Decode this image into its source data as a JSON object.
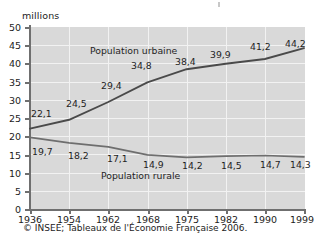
{
  "chart_data": {
    "type": "line",
    "title": "",
    "subtitle": "",
    "xlabel": "",
    "ylabel": "millions",
    "ylim": [
      0,
      50
    ],
    "yticks": [
      0,
      5,
      10,
      15,
      20,
      25,
      30,
      35,
      40,
      45,
      50
    ],
    "categories": [
      "1936",
      "1954",
      "1962",
      "1968",
      "1975",
      "1982",
      "1990",
      "1999"
    ],
    "grid": true,
    "legend_position": "inline-annotation",
    "series": [
      {
        "name": "Population urbaine",
        "values": [
          22.1,
          24.5,
          29.4,
          34.8,
          38.4,
          39.9,
          41.2,
          44.2
        ],
        "labels": [
          "22,1",
          "24,5",
          "29,4",
          "34,8",
          "38,4",
          "39,9",
          "41,2",
          "44,2"
        ],
        "color": "#4a4a4a"
      },
      {
        "name": "Population rurale",
        "values": [
          19.7,
          18.2,
          17.1,
          14.9,
          14.2,
          14.5,
          14.7,
          14.3
        ],
        "labels": [
          "19,7",
          "18,2",
          "17,1",
          "14,9",
          "14,2",
          "14,5",
          "14,7",
          "14,3"
        ],
        "color": "#6e6e6e"
      }
    ],
    "annotations": [
      {
        "text": "Population urbaine"
      },
      {
        "text": "Population rurale"
      }
    ]
  },
  "axis": {
    "unit_label": "millions",
    "y_ticks": [
      "50",
      "45",
      "40",
      "35",
      "30",
      "25",
      "20",
      "15",
      "10",
      "5",
      "0"
    ],
    "x_ticks": [
      "1936",
      "1954",
      "1962",
      "1968",
      "1975",
      "1982",
      "1990",
      "1999"
    ]
  },
  "labels": {
    "urban_series": "Population urbaine",
    "rural_series": "Population rurale",
    "urban_points": [
      "22,1",
      "24,5",
      "29,4",
      "34,8",
      "38,4",
      "39,9",
      "41,2",
      "44,2"
    ],
    "rural_points": [
      "19,7",
      "18,2",
      "17,1",
      "14,9",
      "14,2",
      "14,5",
      "14,7",
      "14,3"
    ]
  },
  "source": {
    "text": "© INSEE; Tableaux de l'Économie Française 2006."
  },
  "colors": {
    "plot_background": "#d9d9d9",
    "gridline": "#f2f2f2",
    "axis": "#6f6f6f",
    "urban_line": "#4a4a4a",
    "rural_line": "#6e6e6e",
    "text": "#1c1c1c"
  }
}
